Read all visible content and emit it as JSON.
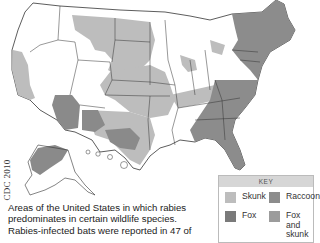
{
  "map": {
    "title": "Rabies reservoirs in wildlife, United States",
    "credit": "CDC 2010",
    "caption": "Areas of the United States in which rabies predominates in certain wildlife species. Rabies-infected bats were reported in 47 of",
    "colors": {
      "none": "#ffffff",
      "skunk": "#bdbdbd",
      "raccoon": "#8c8c8c",
      "fox": "#7a7a7a",
      "fox_and_skunk": "#9c9c9c",
      "border": "#333333"
    }
  },
  "key": {
    "title": "KEY",
    "items": [
      {
        "label": "Skunk",
        "color": "#bdbdbd"
      },
      {
        "label": "Raccoon",
        "color": "#8c8c8c"
      },
      {
        "label": "Fox",
        "color": "#7a7a7a"
      },
      {
        "label": "Fox",
        "label2": "and skunk",
        "color": "#9c9c9c"
      }
    ]
  }
}
